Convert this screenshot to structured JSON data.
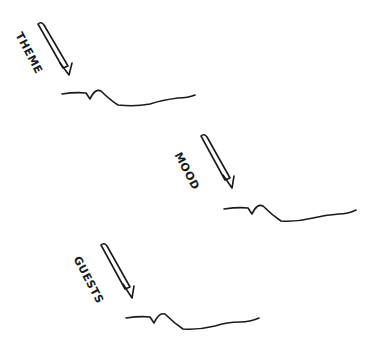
{
  "diagram": {
    "items": [
      {
        "label": "THEME"
      },
      {
        "label": "MOOD"
      },
      {
        "label": "GUESTS"
      }
    ],
    "colors": {
      "ink": "#1a1a1a",
      "background": "#ffffff"
    }
  }
}
